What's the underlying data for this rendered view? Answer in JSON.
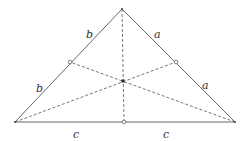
{
  "diagram": {
    "vertices": {
      "top": [
        122,
        9
      ],
      "left": [
        15,
        122
      ],
      "right": [
        235,
        122
      ]
    },
    "midpoints": {
      "left_side": [
        70,
        62
      ],
      "right_side": [
        176,
        62
      ],
      "base": [
        124,
        122
      ]
    },
    "centroid": [
      123,
      81
    ],
    "labels": {
      "left_upper": "b",
      "left_lower": "b",
      "right_upper": "a",
      "right_lower": "a",
      "base_left": "c",
      "base_right": "c"
    },
    "colors": {
      "stroke": "#555555",
      "text": "#333333"
    }
  }
}
